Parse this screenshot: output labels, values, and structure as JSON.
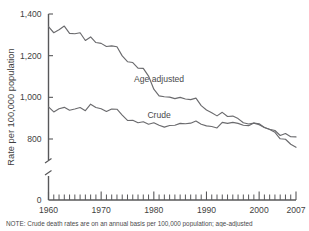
{
  "chart_data": {
    "type": "line",
    "title": "",
    "xlabel": "",
    "ylabel": "Rate per 100,000 population",
    "xlim": [
      1960,
      2007
    ],
    "ylim": [
      760,
      1400
    ],
    "y_axis_break": true,
    "y_break_low": 0,
    "yticks": [
      800,
      1000,
      1200,
      1400
    ],
    "ytick_labels": [
      "800",
      "1,000",
      "1,200",
      "1,400"
    ],
    "y_zero_label": "0",
    "xticks": [
      1960,
      1970,
      1980,
      1990,
      2000,
      2007
    ],
    "xtick_labels": [
      "1960",
      "1970",
      "1980",
      "1990",
      "2000",
      "2007"
    ],
    "x_minor_tick_interval": 1,
    "grid": false,
    "legend_position": "inline-annotation",
    "series": [
      {
        "name": "Age adjusted",
        "label": "Age adjusted",
        "color": "#6b6b6e",
        "x": [
          1960,
          1961,
          1962,
          1963,
          1964,
          1965,
          1966,
          1967,
          1968,
          1969,
          1970,
          1971,
          1972,
          1973,
          1974,
          1975,
          1976,
          1977,
          1978,
          1979,
          1980,
          1981,
          1982,
          1983,
          1984,
          1985,
          1986,
          1987,
          1988,
          1989,
          1990,
          1991,
          1992,
          1993,
          1994,
          1995,
          1996,
          1997,
          1998,
          1999,
          2000,
          2001,
          2002,
          2003,
          2004,
          2005,
          2006,
          2007
        ],
        "values": [
          1339,
          1310,
          1324,
          1342,
          1307,
          1305,
          1310,
          1273,
          1290,
          1263,
          1259,
          1244,
          1247,
          1243,
          1199,
          1171,
          1167,
          1140,
          1139,
          1102,
          1039,
          1007,
          1003,
          1001,
          994,
          1000,
          992,
          989,
          996,
          960,
          939,
          926,
          911,
          928,
          908,
          910,
          898,
          878,
          872,
          876,
          869,
          855,
          846,
          832,
          801,
          799,
          775,
          760
        ]
      },
      {
        "name": "Crude",
        "label": "Crude",
        "color": "#6b6b6e",
        "x": [
          1960,
          1961,
          1962,
          1963,
          1964,
          1965,
          1966,
          1967,
          1968,
          1969,
          1970,
          1971,
          1972,
          1973,
          1974,
          1975,
          1976,
          1977,
          1978,
          1979,
          1980,
          1981,
          1982,
          1983,
          1984,
          1985,
          1986,
          1987,
          1988,
          1989,
          1990,
          1991,
          1992,
          1993,
          1994,
          1995,
          1996,
          1997,
          1998,
          1999,
          2000,
          2001,
          2002,
          2003,
          2004,
          2005,
          2006,
          2007
        ],
        "values": [
          954,
          930,
          945,
          952,
          938,
          944,
          951,
          936,
          967,
          951,
          945,
          932,
          944,
          943,
          915,
          889,
          890,
          878,
          883,
          871,
          878,
          866,
          857,
          865,
          866,
          875,
          873,
          876,
          886,
          871,
          863,
          860,
          853,
          880,
          875,
          880,
          875,
          866,
          864,
          877,
          873,
          855,
          847,
          841,
          817,
          826,
          811,
          810
        ]
      }
    ],
    "annotations": [
      {
        "text": "Age adjusted",
        "x": 1981,
        "y": 1075
      },
      {
        "text": "Crude",
        "x": 1981,
        "y": 900
      }
    ]
  },
  "note": {
    "text": "NOTE: Crude death rates are on an annual basis per 100,000 population; age-adjusted"
  }
}
